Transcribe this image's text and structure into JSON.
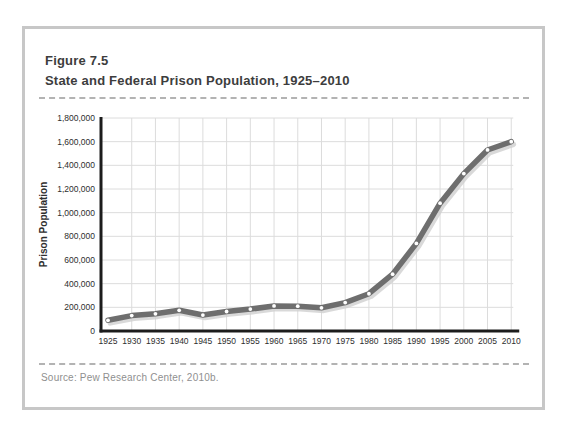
{
  "figure": {
    "label": "Figure 7.5",
    "title": "State and Federal Prison Population, 1925–2010",
    "source": "Source: Pew Research Center, 2010b."
  },
  "chart_data": {
    "type": "line",
    "title": "State and Federal Prison Population, 1925–2010",
    "xlabel": "",
    "ylabel": "Prison Population",
    "x": [
      1925,
      1930,
      1935,
      1940,
      1945,
      1950,
      1955,
      1960,
      1965,
      1970,
      1975,
      1980,
      1985,
      1990,
      1995,
      2000,
      2005,
      2010
    ],
    "series": [
      {
        "name": "State and federal prison population",
        "values": [
          90000,
          130000,
          145000,
          175000,
          135000,
          165000,
          185000,
          212000,
          210000,
          196000,
          240000,
          315000,
          480000,
          740000,
          1080000,
          1330000,
          1530000,
          1600000
        ]
      }
    ],
    "ylim": [
      0,
      1800000
    ],
    "ytick_step": 200000,
    "grid": true,
    "legend": "none",
    "line_color": "#6e6e6e",
    "line_shadow_color": "#cfcfcf",
    "marker_color": "#ffffff",
    "axis_color": "#1c1c1c",
    "grid_color": "#dcdcdc",
    "tick_label_color": "#2e2e2e"
  }
}
